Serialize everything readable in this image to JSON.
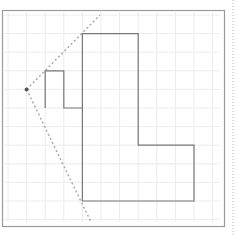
{
  "diagram": {
    "type": "grid-geometry",
    "grid": {
      "origin_px": [
        8,
        15
      ],
      "cell_px": 18.6,
      "cols": 12,
      "rows": 12,
      "color": "#ececec"
    },
    "frame": {
      "x": 2,
      "y": 10,
      "width": 222,
      "height": 216,
      "color": "#9a9a9a"
    },
    "side_dotted_line": {
      "x": 233,
      "color": "#b5b5b5"
    },
    "shape": {
      "stroke": "#777777",
      "grid_points": [
        [
          4,
          1
        ],
        [
          7,
          1
        ],
        [
          7,
          7
        ],
        [
          10,
          7
        ],
        [
          10,
          10
        ],
        [
          4,
          10
        ],
        [
          4,
          5
        ],
        [
          3,
          5
        ],
        [
          3,
          3
        ],
        [
          2,
          3
        ],
        [
          2,
          5.0
        ],
        [
          3,
          5
        ],
        [
          4,
          5
        ]
      ]
    },
    "point": {
      "grid": [
        1,
        4
      ],
      "color": "#555555"
    },
    "rays": {
      "color": "#aaaaaa",
      "ends_px": [
        [
          100,
          15
        ],
        [
          91,
          222
        ]
      ]
    }
  }
}
